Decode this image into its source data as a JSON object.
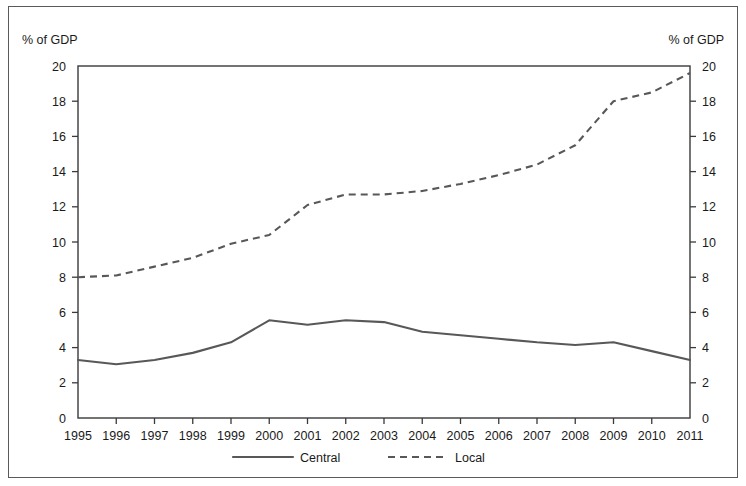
{
  "chart_data": {
    "type": "line",
    "title": "",
    "subtitle": "",
    "xlabel": "",
    "ylabel": "% of GDP",
    "ylabel_right": "% of GDP",
    "x": [
      1995,
      1996,
      1997,
      1998,
      1999,
      2000,
      2001,
      2002,
      2003,
      2004,
      2005,
      2006,
      2007,
      2008,
      2009,
      2010,
      2011
    ],
    "categories": [
      "1995",
      "1996",
      "1997",
      "1998",
      "1999",
      "2000",
      "2001",
      "2002",
      "2003",
      "2004",
      "2005",
      "2006",
      "2007",
      "2008",
      "2009",
      "2010",
      "2011"
    ],
    "series": [
      {
        "name": "Central",
        "style": "solid",
        "color": "#585858",
        "values": [
          3.3,
          3.05,
          3.3,
          3.7,
          4.3,
          5.55,
          5.3,
          5.55,
          5.45,
          4.9,
          4.7,
          4.5,
          4.3,
          4.15,
          4.3,
          3.8,
          3.3
        ]
      },
      {
        "name": "Local",
        "style": "dashed",
        "color": "#585858",
        "values": [
          8.0,
          8.1,
          8.6,
          9.1,
          9.9,
          10.4,
          12.1,
          12.7,
          12.7,
          12.9,
          13.3,
          13.8,
          14.4,
          15.5,
          18.0,
          18.5,
          19.6
        ]
      }
    ],
    "ylim": [
      0,
      20
    ],
    "ytick_step": 2,
    "yticks": [
      0,
      2,
      4,
      6,
      8,
      10,
      12,
      14,
      16,
      18,
      20
    ],
    "ytick_labels": [
      "0",
      "2",
      "4",
      "6",
      "8",
      "10",
      "12",
      "14",
      "16",
      "18",
      "20"
    ],
    "grid": false,
    "legend_position": "bottom",
    "legend": [
      "Central",
      "Local"
    ],
    "dual_axis": true
  },
  "axes": {
    "left_unit": "% of GDP",
    "right_unit": "% of GDP"
  },
  "legend": {
    "items": [
      {
        "label": "Central",
        "style": "solid"
      },
      {
        "label": "Local",
        "style": "dashed"
      }
    ]
  }
}
